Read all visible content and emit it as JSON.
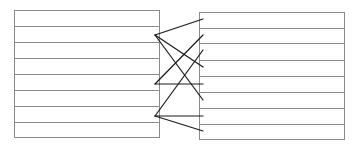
{
  "diagram": {
    "colors": {
      "background": "#ffffff",
      "box_stroke": "#8a8a8a",
      "row_stroke": "#8a8a8a",
      "edge_stroke": "#1a1a1a"
    },
    "left_table": {
      "x": 14,
      "y": 10,
      "width": 145,
      "height": 127,
      "rows": 8,
      "divider_ys": [
        26,
        42,
        58,
        74,
        90,
        106,
        122
      ]
    },
    "right_table": {
      "x": 199,
      "y": 12,
      "width": 145,
      "height": 127,
      "rows": 8,
      "divider_ys": [
        28,
        43,
        60,
        76,
        92,
        108,
        124
      ]
    },
    "nodes": [
      {
        "id": "L1",
        "x": 155,
        "y": 35
      },
      {
        "id": "L2",
        "x": 155,
        "y": 84
      },
      {
        "id": "L3",
        "x": 155,
        "y": 116
      }
    ],
    "edges": [
      {
        "from": "L1",
        "to_y": 19
      },
      {
        "from": "L1",
        "to_y": 67
      },
      {
        "from": "L1",
        "to_y": 100
      },
      {
        "from": "L2",
        "to_y": 35
      },
      {
        "from": "L2",
        "to_y": 84
      },
      {
        "from": "L3",
        "to_y": 50
      },
      {
        "from": "L3",
        "to_y": 116
      },
      {
        "from": "L3",
        "to_y": 131
      }
    ],
    "edge_end_x": 203
  }
}
